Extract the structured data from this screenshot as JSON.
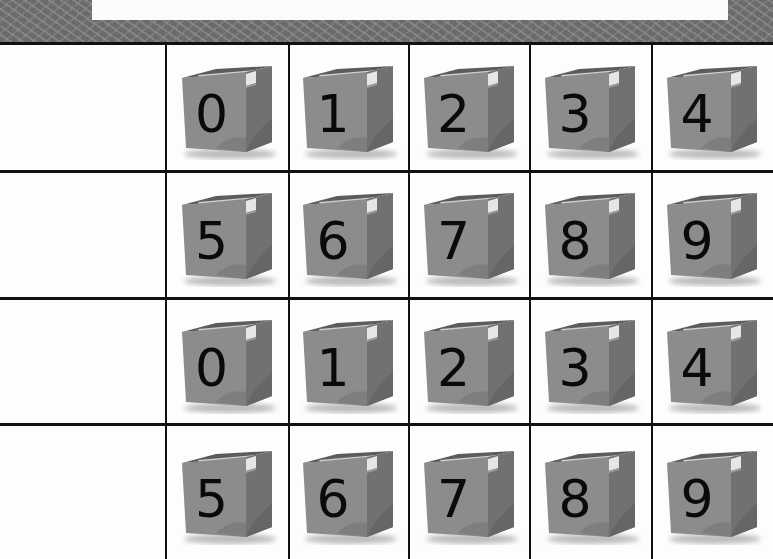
{
  "worksheet": {
    "title": "",
    "border_pattern": "gray-sprinkle",
    "colors": {
      "frame": "#6a6a6a",
      "grid_line": "#111111",
      "box_front": "#8c8c8c",
      "box_side": "#6f6f6f",
      "box_top": "#5c5c5c",
      "tape": "#d8d8d8",
      "digit": "#0a0a0a"
    },
    "rows": [
      {
        "label": "",
        "cards": [
          {
            "digit": "0"
          },
          {
            "digit": "1"
          },
          {
            "digit": "2"
          },
          {
            "digit": "3"
          },
          {
            "digit": "4"
          }
        ]
      },
      {
        "label": "",
        "cards": [
          {
            "digit": "5"
          },
          {
            "digit": "6"
          },
          {
            "digit": "7"
          },
          {
            "digit": "8"
          },
          {
            "digit": "9"
          }
        ]
      },
      {
        "label": "",
        "cards": [
          {
            "digit": "0"
          },
          {
            "digit": "1"
          },
          {
            "digit": "2"
          },
          {
            "digit": "3"
          },
          {
            "digit": "4"
          }
        ]
      },
      {
        "label": "",
        "cards": [
          {
            "digit": "5"
          },
          {
            "digit": "6"
          },
          {
            "digit": "7"
          },
          {
            "digit": "8"
          },
          {
            "digit": "9"
          }
        ]
      }
    ]
  }
}
